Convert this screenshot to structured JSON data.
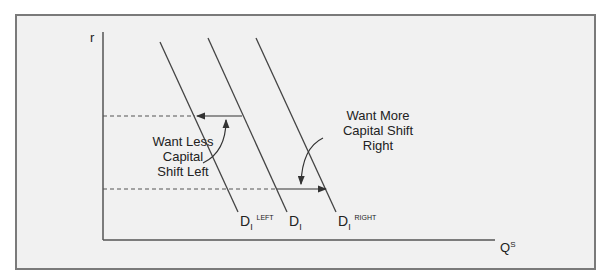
{
  "diagram": {
    "y_axis_label": "r",
    "x_axis_label": "Q",
    "x_axis_label_sup": "S",
    "curves": [
      {
        "name": "D",
        "sub": "I",
        "sup": "LEFT"
      },
      {
        "name": "D",
        "sub": "I",
        "sup": ""
      },
      {
        "name": "D",
        "sub": "I",
        "sup": "RIGHT"
      }
    ],
    "annotations": {
      "left": [
        "Want Less",
        "Capital",
        "Shift Left"
      ],
      "right": [
        "Want More",
        "Capital  Shift",
        "Right"
      ]
    },
    "colors": {
      "background": "#f1f1f1",
      "frame": "#7a7a7a",
      "lines": "#444444",
      "dashes": "#555555"
    }
  }
}
